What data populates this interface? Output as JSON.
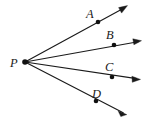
{
  "figure": {
    "kind": "geometry-diagram",
    "width": 144,
    "height": 124,
    "background_color": "#ffffff",
    "stroke_color": "#1a1a1a",
    "vertex": {
      "label": "P",
      "x": 25,
      "y": 62,
      "label_x": 10,
      "label_y": 67,
      "dot_radius": 2.6
    },
    "rays": [
      {
        "name": "ray-PA",
        "label": "A",
        "label_x": 86,
        "label_y": 18,
        "point_x": 98,
        "point_y": 22,
        "tip_x": 127,
        "tip_y": 6,
        "dot_radius": 2.3
      },
      {
        "name": "ray-PB",
        "label": "B",
        "label_x": 106,
        "label_y": 39,
        "point_x": 114,
        "point_y": 45,
        "tip_x": 141,
        "tip_y": 41,
        "dot_radius": 2.3
      },
      {
        "name": "ray-PC",
        "label": "C",
        "label_x": 105,
        "label_y": 71,
        "point_x": 112,
        "point_y": 77,
        "tip_x": 140,
        "tip_y": 79,
        "dot_radius": 2.3
      },
      {
        "name": "ray-PD",
        "label": "D",
        "label_x": 92,
        "label_y": 98,
        "point_x": 96,
        "point_y": 101,
        "tip_x": 126,
        "tip_y": 114,
        "dot_radius": 2.3
      }
    ]
  }
}
